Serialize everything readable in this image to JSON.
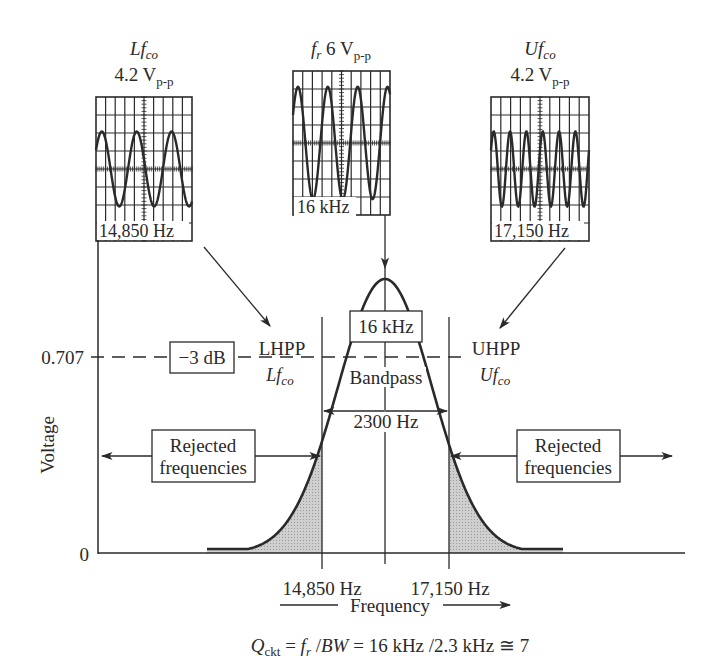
{
  "chart_data": {
    "type": "area",
    "xlabel": "Frequency",
    "ylabel": "Voltage",
    "y_ticks": [
      "0",
      "0.707"
    ],
    "x_ticks": [
      "14,850 Hz",
      "17,150 Hz"
    ],
    "resonant_frequency": "16 kHz",
    "lower_cutoff": "14,850 Hz",
    "upper_cutoff": "17,150 Hz",
    "bandwidth": "2300 Hz",
    "half_power_level": 0.707,
    "grid": false,
    "series": [
      {
        "name": "response",
        "x_hz": [
          13400,
          14000,
          14850,
          15400,
          16000,
          16600,
          17150,
          18000,
          18600
        ],
        "y": [
          0.02,
          0.25,
          0.707,
          0.93,
          1.0,
          0.93,
          0.707,
          0.25,
          0.02
        ]
      }
    ]
  },
  "axes": {
    "y_label": "Voltage",
    "y_tick_0707": "0.707",
    "y_tick_0": "0",
    "x_label": "Frequency",
    "x_tick_low": "14,850 Hz",
    "x_tick_high": "17,150 Hz"
  },
  "annotations": {
    "db_box": "−3 dB",
    "center_box": "16 kHz",
    "lhpp": "LHPP",
    "lhpp_sub_main": "Lf",
    "lhpp_sub_sub": "co",
    "uhpp": "UHPP",
    "uhpp_sub_main": "Uf",
    "uhpp_sub_sub": "co",
    "bandpass_line1": "Bandpass",
    "bandpass_line2": "2300 Hz",
    "rejected_left_line1": "Rejected",
    "rejected_left_line2": "frequencies",
    "rejected_right_line1": "Rejected",
    "rejected_right_line2": "frequencies"
  },
  "scopes": {
    "left": {
      "title_main": "Lf",
      "title_sub": "co",
      "amp_main": "4.2 V",
      "amp_sub": "p-p",
      "freq": "14,850 Hz",
      "cycles": 2.75
    },
    "center": {
      "title_main": "f",
      "title_sub": "r",
      "amp_main": "6 V",
      "amp_sub": "p-p",
      "freq": "16 kHz",
      "cycles": 3.25
    },
    "right": {
      "title_main": "Uf",
      "title_sub": "co",
      "amp_main": "4.2 V",
      "amp_sub": "p-p",
      "freq": "17,150 Hz",
      "cycles": 6.0
    }
  },
  "formula": {
    "q": "Q",
    "q_sub": "ckt",
    "eq1": " = ",
    "fr": "f",
    "fr_sub": "r",
    "slash": " /",
    "bw": "BW",
    "rest": " = 16 kHz /2.3 kHz ≅ 7"
  },
  "colors": {
    "ink": "#2a2a2a",
    "shade": "#c8c8c8",
    "background": "#ffffff"
  }
}
